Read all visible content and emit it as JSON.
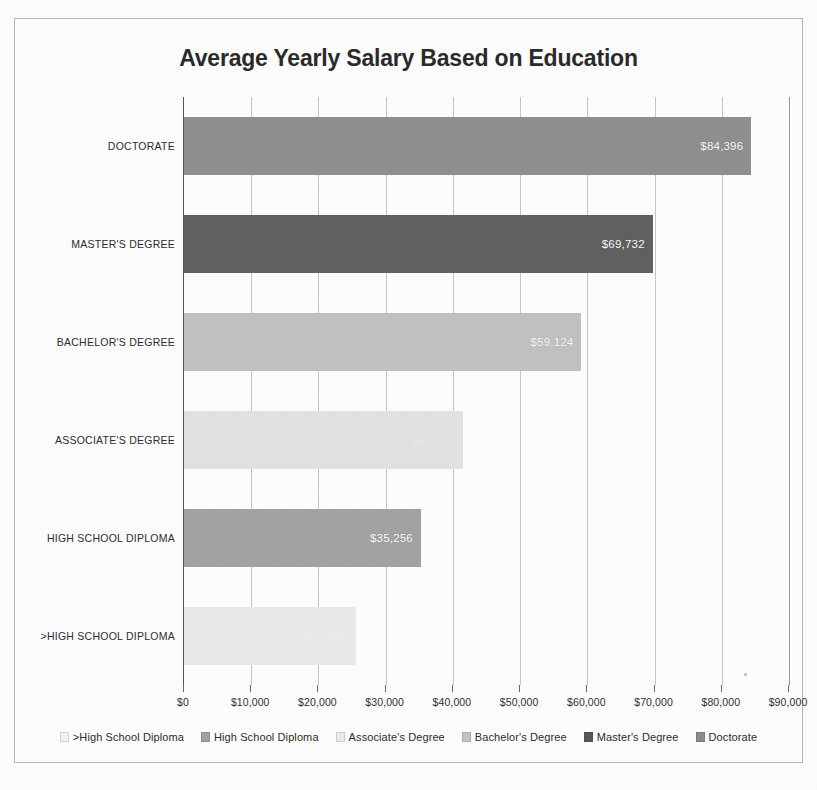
{
  "chart_data": {
    "type": "bar",
    "orientation": "horizontal",
    "title": "Average Yearly Salary Based on Education",
    "xlabel": "",
    "ylabel": "",
    "xlim": [
      0,
      90000
    ],
    "grid": true,
    "legend_position": "bottom",
    "categories": [
      "DOCTORATE",
      "MASTER'S DEGREE",
      "BACHELOR'S DEGREE",
      "ASSOCIATE'S DEGREE",
      "HIGH SCHOOL DIPLOMA",
      ">HIGH SCHOOL DIPLOMA"
    ],
    "values": [
      84396,
      69732,
      59124,
      41496,
      35256,
      25636
    ],
    "value_labels": [
      "$84,396",
      "$69,732",
      "$59,124",
      "$41,496",
      "$35,256",
      "$25,636"
    ],
    "value_label_visibility": [
      "visible",
      "visible",
      "visible",
      "faded",
      "visible",
      "invisible"
    ],
    "bar_colors": [
      "#8e8e8e",
      "#585858",
      "#c6c6c6",
      "#ececec",
      "#a4a4a4",
      "#f4f4f4"
    ],
    "tick_labels": [
      "$0",
      "$10,000",
      "$20,000",
      "$30,000",
      "$40,000",
      "$50,000",
      "$60,000",
      "$70,000",
      "$80,000",
      "$90,000"
    ],
    "tick_values": [
      0,
      10000,
      20000,
      30000,
      40000,
      50000,
      60000,
      70000,
      80000,
      90000
    ],
    "legend": [
      {
        "label": ">High School Diploma",
        "color": "#f4f4f4"
      },
      {
        "label": "High School Diploma",
        "color": "#a4a4a4"
      },
      {
        "label": "Associate's Degree",
        "color": "#ececec"
      },
      {
        "label": "Bachelor's Degree",
        "color": "#c6c6c6"
      },
      {
        "label": "Master's Degree",
        "color": "#585858"
      },
      {
        "label": "Doctorate",
        "color": "#8e8e8e"
      }
    ]
  }
}
